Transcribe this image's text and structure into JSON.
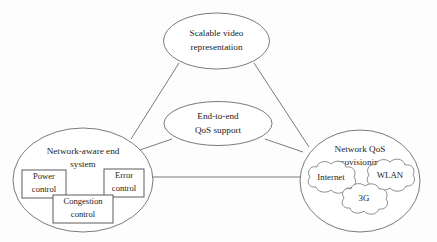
{
  "diagram": {
    "background_color": "#fdfdfd",
    "stroke_color": "#6b6b6b",
    "text_color": "#1d1d1d",
    "nodes": {
      "scalable_video": {
        "line1": "Scalable video",
        "line2": "representation",
        "shape": "ellipse"
      },
      "end_to_end": {
        "line1": "End-to-end",
        "line2": "QoS support",
        "shape": "ellipse"
      },
      "network_aware": {
        "line1": "Network-aware end",
        "line2": "system",
        "shape": "ellipse"
      },
      "network_qos": {
        "line1": "Network QoS",
        "line2": "provisioning",
        "shape": "ellipse"
      }
    },
    "boxes": {
      "power_control": {
        "line1": "Power",
        "line2": "control",
        "shape": "rectangle"
      },
      "error_control": {
        "line1": "Error",
        "line2": "control",
        "shape": "rectangle"
      },
      "congestion_control": {
        "line1": "Congestion",
        "line2": "control",
        "shape": "rectangle"
      }
    },
    "clouds": {
      "internet": {
        "label": "Internet",
        "shape": "cloud"
      },
      "wlan": {
        "label": "WLAN",
        "shape": "cloud"
      },
      "threeg": {
        "label": "3G",
        "shape": "cloud"
      }
    },
    "connectors": [
      {
        "from": "scalable_video",
        "to": "network_aware"
      },
      {
        "from": "scalable_video",
        "to": "network_qos"
      },
      {
        "from": "end_to_end",
        "to": "network_aware"
      },
      {
        "from": "end_to_end",
        "to": "network_qos"
      },
      {
        "from": "network_aware",
        "to": "network_qos"
      }
    ]
  }
}
